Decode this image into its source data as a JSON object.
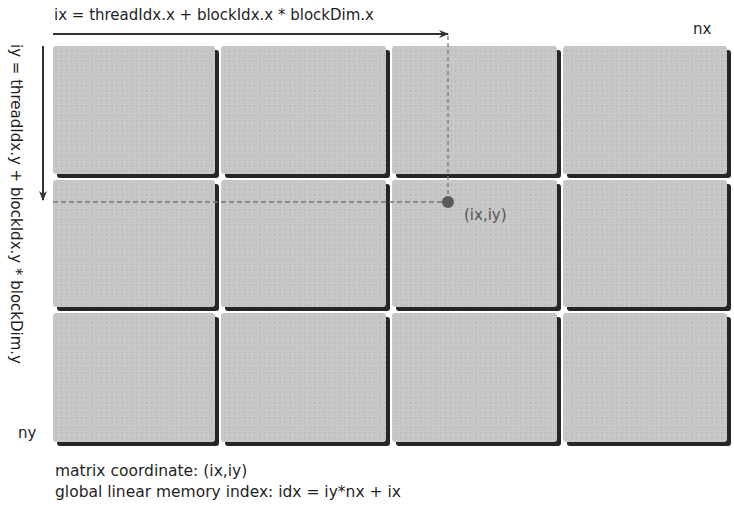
{
  "diagram": {
    "x_formula": "ix = threadIdx.x + blockIdx.x * blockDim.x",
    "y_formula": "iy = threadIdx.y + blockIdx.y * blockDim.y",
    "x_extent_label": "nx",
    "y_extent_label": "ny",
    "point_label": "(ix,iy)",
    "grid": {
      "rows": 3,
      "cols": 4,
      "tile_color": "#c6c6c6",
      "shadow_color": "#262626"
    },
    "highlight": {
      "column_index": 2,
      "row_index": 1
    },
    "caption": {
      "line1": "matrix coordinate: (ix,iy)",
      "line2": "global linear memory index: idx = iy*nx + ix"
    }
  }
}
